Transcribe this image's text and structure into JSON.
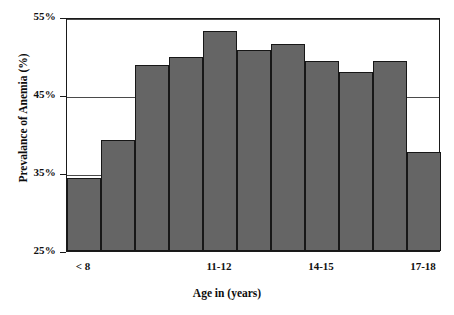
{
  "chart_data": {
    "type": "bar",
    "title": "",
    "xlabel": "Age in (years)",
    "ylabel": "Prevalance of Anemia (%)",
    "ylim": [
      25,
      55
    ],
    "yticks": [
      25,
      35,
      45,
      55
    ],
    "ytick_labels": [
      "25%",
      "35%",
      "45%",
      "55%"
    ],
    "grid": true,
    "gridlines_at": [
      35,
      45,
      55
    ],
    "legend": null,
    "bar_color": "#656565",
    "bar_edge_color": "#171717",
    "categories": [
      "< 8",
      "8-9",
      "9-10",
      "10-11",
      "11-12",
      "12-13",
      "13-14",
      "14-15",
      "15-16",
      "16-17",
      "17-18"
    ],
    "xtick_labels": [
      "< 8",
      "11-12",
      "14-15",
      "17-18"
    ],
    "xtick_label_positions": [
      0,
      4,
      7,
      10
    ],
    "values": [
      34.4,
      39.2,
      48.9,
      49.9,
      53.2,
      50.8,
      51.6,
      49.3,
      48.0,
      49.3,
      37.7
    ]
  }
}
